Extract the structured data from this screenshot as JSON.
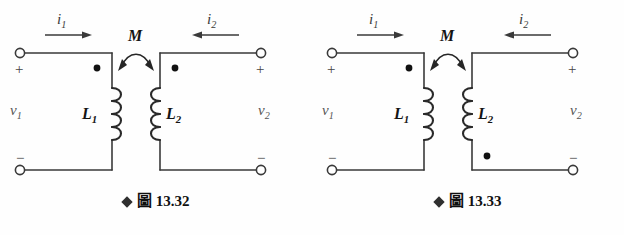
{
  "page": {
    "background_color": "#ffffff",
    "ink_color": "#1a1a1a",
    "kind": "textbook-figure-pair",
    "topic": "mutually coupled inductors with dot convention"
  },
  "figures": [
    {
      "id": "fig-13-32",
      "caption": {
        "bullet": "diamond-bullet",
        "word": "圖",
        "number": "13.32",
        "full": "◆ 圖 13.32"
      },
      "labels": {
        "current_left": "i",
        "current_left_sub": "1",
        "current_right": "i",
        "current_right_sub": "2",
        "mutual": "M",
        "inductor_left": "L",
        "inductor_left_sub": "1",
        "inductor_right": "L",
        "inductor_right_sub": "2",
        "voltage_left": "v",
        "voltage_left_sub": "1",
        "voltage_right": "v",
        "voltage_right_sub": "2",
        "plus_left": "+",
        "minus_left": "−",
        "plus_right": "+",
        "minus_right": "−"
      },
      "dots": {
        "left_coil": "top",
        "right_coil": "top"
      },
      "current_direction": {
        "left": "rightward",
        "right": "leftward"
      }
    },
    {
      "id": "fig-13-33",
      "caption": {
        "bullet": "diamond-bullet",
        "word": "圖",
        "number": "13.33",
        "full": "◆ 圖 13.33"
      },
      "labels": {
        "current_left": "i",
        "current_left_sub": "1",
        "current_right": "i",
        "current_right_sub": "2",
        "mutual": "M",
        "inductor_left": "L",
        "inductor_left_sub": "1",
        "inductor_right": "L",
        "inductor_right_sub": "2",
        "voltage_left": "v",
        "voltage_left_sub": "1",
        "voltage_right": "v",
        "voltage_right_sub": "2",
        "plus_left": "+",
        "minus_left": "−",
        "plus_right": "+",
        "minus_right": "−"
      },
      "dots": {
        "left_coil": "top",
        "right_coil": "bottom"
      },
      "current_direction": {
        "left": "rightward",
        "right": "leftward"
      }
    }
  ]
}
